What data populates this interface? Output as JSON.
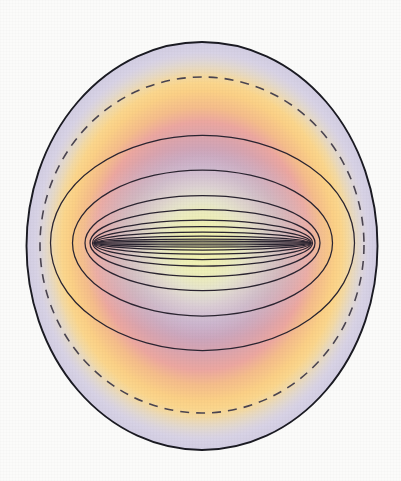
{
  "figure": {
    "background_color": "#fbfbfa",
    "canvas": {
      "width": 401,
      "height": 481
    }
  },
  "chart_data": {
    "type": "contour",
    "subtitle": "",
    "xlabel": "",
    "ylabel": "",
    "grid": false,
    "legend": false,
    "axis_visible": false,
    "tick_labels": [],
    "annotations": [],
    "center": {
      "x": 202,
      "y": 246
    },
    "foci": [
      {
        "name": "left-focus",
        "x": 95,
        "y": 243
      },
      {
        "name": "right-focus",
        "x": 310,
        "y": 243
      }
    ],
    "focal_half_distance": 107.5,
    "xlim": [
      27,
      378
    ],
    "ylim": [
      42,
      450
    ],
    "series": [
      {
        "name": "outer-boundary",
        "style": "solid",
        "stroke": "#1a1a22",
        "stroke_width": 1.9,
        "rx": 175.5,
        "ry": 204,
        "confocal": false
      },
      {
        "name": "dashed-boundary",
        "style": "dashed",
        "stroke": "#4a4450",
        "stroke_width": 1.6,
        "dash": "9 7",
        "rx": 162,
        "ry": 168,
        "confocal": false
      }
    ],
    "confocal_ellipses": [
      {
        "name": "ellipse-1",
        "a": 152.0,
        "b": 107.5
      },
      {
        "name": "ellipse-2",
        "a": 130.0,
        "b": 73.0
      },
      {
        "name": "ellipse-3",
        "a": 117.5,
        "b": 47.5
      },
      {
        "name": "ellipse-4",
        "a": 112.5,
        "b": 33.5
      },
      {
        "name": "ellipse-5",
        "a": 110.0,
        "b": 23.0
      },
      {
        "name": "ellipse-6",
        "a": 108.8,
        "b": 16.5
      },
      {
        "name": "ellipse-7",
        "a": 108.2,
        "b": 11.0
      },
      {
        "name": "ellipse-8",
        "a": 107.8,
        "b": 7.0
      },
      {
        "name": "ellipse-9",
        "a": 107.6,
        "b": 4.0
      },
      {
        "name": "ellipse-10",
        "a": 107.5,
        "b": 1.8
      }
    ],
    "color_field": {
      "type": "radial",
      "description": "Radial colour ramp from pale yellow core outward through lavender, pink, orange and back to pale lavender at the rim.",
      "stops": [
        {
          "offset": 0.0,
          "color": "#f2f2b4",
          "label": "core-pale-yellow"
        },
        {
          "offset": 0.13,
          "color": "#eceeba",
          "label": "pale-yellow"
        },
        {
          "offset": 0.24,
          "color": "#dcd6e6",
          "label": "light-lavender"
        },
        {
          "offset": 0.36,
          "color": "#c7aecb",
          "label": "mauve"
        },
        {
          "offset": 0.47,
          "color": "#cda3b6",
          "label": "dusty-rose"
        },
        {
          "offset": 0.58,
          "color": "#e8a5a4",
          "label": "salmon-pink"
        },
        {
          "offset": 0.68,
          "color": "#f5bd8b",
          "label": "peach"
        },
        {
          "offset": 0.78,
          "color": "#fbd287",
          "label": "amber"
        },
        {
          "offset": 0.86,
          "color": "#fbdf99",
          "label": "light-amber"
        },
        {
          "offset": 0.93,
          "color": "#e2dcea",
          "label": "pale-lavender"
        },
        {
          "offset": 1.0,
          "color": "#d5d0e4",
          "label": "rim-lavender"
        }
      ]
    }
  }
}
